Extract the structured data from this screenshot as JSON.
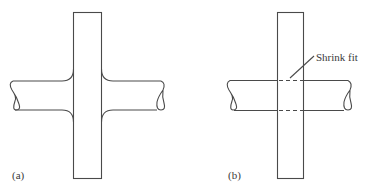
{
  "figure": {
    "panels": [
      {
        "id": "a",
        "label": "(a)",
        "description": "Shaft and disk forged/integral with fillets"
      },
      {
        "id": "b",
        "label": "(b)",
        "description": "Shaft and disk joined by shrink fit",
        "annotation": "Shrink fit"
      }
    ],
    "colors": {
      "line": "#4a4a4a",
      "background": "#ffffff",
      "text": "#3a3a3a"
    }
  }
}
